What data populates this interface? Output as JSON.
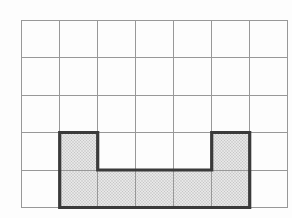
{
  "figure": {
    "type": "grid-diagram",
    "grid": {
      "columns": 7,
      "rows": 5,
      "left": 21.7,
      "top": 20,
      "right": 287.7,
      "bottom": 207.5,
      "line_color": "#989898",
      "line_width": 1,
      "background_color": "#fdfdfd"
    },
    "shaded_shape": {
      "description": "U-shaped shaded region sitting on the bottom grid line",
      "outline_grid_units": [
        [
          1,
          3
        ],
        [
          2,
          3
        ],
        [
          2,
          4
        ],
        [
          5,
          4
        ],
        [
          5,
          3
        ],
        [
          6,
          3
        ],
        [
          6,
          5
        ],
        [
          1,
          5
        ]
      ],
      "shaded_cells_col_row": [
        [
          1,
          3
        ],
        [
          5,
          3
        ],
        [
          1,
          4
        ],
        [
          2,
          4
        ],
        [
          3,
          4
        ],
        [
          4,
          4
        ],
        [
          5,
          4
        ]
      ],
      "shaded_cell_count": 7,
      "fill_base_color": "#e7e7e7",
      "fill_dot_color": "#b9b9b9",
      "border_color": "#3a3a3a",
      "border_width": 3.2
    }
  },
  "artifacts": {
    "left_edge_mark_color": "#b0b0b0"
  }
}
